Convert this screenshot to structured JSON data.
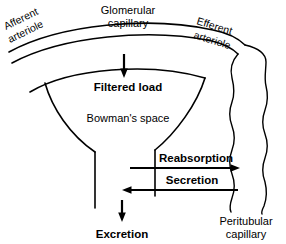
{
  "diagram": {
    "colors": {
      "background": "#ffffff",
      "ink": "#000000"
    },
    "labels": {
      "afferent_arteriole_line1": "Afferent",
      "afferent_arteriole_line2": "arteriole",
      "glomerular_capillary_line1": "Glomerular",
      "glomerular_capillary_line2": "capillary",
      "efferent_arteriole_line1": "Efferent",
      "efferent_arteriole_line2": "arteriole",
      "filtered_load": "Filtered load",
      "bowmans_space": "Bowman's space",
      "reabsorption": "Reabsorption",
      "secretion": "Secretion",
      "excretion": "Excretion",
      "peritubular_capillary_line1": "Peritubular",
      "peritubular_capillary_line2": "capillary"
    },
    "arrows": [
      {
        "name": "filtered-load-arrow",
        "direction": "down"
      },
      {
        "name": "reabsorption-arrow",
        "direction": "right"
      },
      {
        "name": "secretion-arrow",
        "direction": "left"
      },
      {
        "name": "excretion-arrow",
        "direction": "down"
      }
    ],
    "structures": [
      {
        "name": "glomerular-capillary-wall",
        "type": "arc-pair"
      },
      {
        "name": "bowmans-capsule-wall",
        "type": "funnel"
      },
      {
        "name": "tubule-wall",
        "type": "vertical-pair"
      },
      {
        "name": "peritubular-capillary-wall",
        "type": "wavy-pair"
      }
    ]
  }
}
